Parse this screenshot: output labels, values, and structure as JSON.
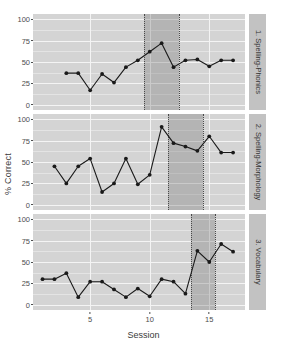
{
  "chart_data": {
    "type": "line",
    "title": "",
    "xlabel": "Session",
    "ylabel": "% Correct",
    "xlim": [
      0.2,
      18.0
    ],
    "ylim": [
      -6,
      106
    ],
    "xticks": [
      5,
      10,
      15
    ],
    "yticks": [
      0,
      25,
      50,
      75,
      100
    ],
    "ytick_labels": [
      "0",
      "25",
      "50",
      "75",
      "100"
    ],
    "grid": true,
    "legend": "none",
    "marker": "filled-circle",
    "line_color": "#1a1a1a",
    "marker_color": "#1a1a1a",
    "panel_background": "#d4d4d4",
    "gridline_color": "#f4f4f4",
    "shaded_band_color": "#8c8c8c",
    "dotted_line_color": "#4a4a4a",
    "strip_background": "#c2c2c2",
    "panels": [
      {
        "label": "1. Spelling-Phonics",
        "band": [
          9.5,
          12.5
        ],
        "x": [
          3,
          4,
          5,
          6,
          7,
          8,
          9,
          10,
          11,
          12,
          13,
          14,
          15,
          16,
          17
        ],
        "y": [
          37,
          37,
          17,
          36,
          26,
          44,
          52,
          62,
          72,
          44,
          52,
          53,
          45,
          52,
          52
        ]
      },
      {
        "label": "2. Spelling-Morphology",
        "band": [
          11.5,
          14.5
        ],
        "x": [
          2,
          3,
          4,
          5,
          6,
          7,
          8,
          9,
          10,
          11,
          12,
          13,
          14,
          15,
          16,
          17
        ],
        "y": [
          45,
          25,
          45,
          54,
          15,
          25,
          54,
          24,
          35,
          91,
          72,
          68,
          63,
          80,
          61,
          61
        ]
      },
      {
        "label": "3. Vocabulary",
        "band": [
          13.5,
          15.5
        ],
        "x": [
          1,
          2,
          3,
          4,
          5,
          6,
          7,
          8,
          9,
          10,
          11,
          12,
          13,
          14,
          15,
          16,
          17
        ],
        "y": [
          30,
          30,
          37,
          9,
          27,
          27,
          18,
          9,
          19,
          10,
          30,
          27,
          13,
          63,
          50,
          71,
          62
        ]
      }
    ]
  },
  "axes": {
    "y_title": "% Correct",
    "x_title": "Session"
  }
}
